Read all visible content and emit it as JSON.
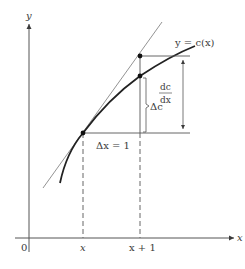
{
  "diagram": {
    "type": "marginal-cost-tangent-approximation",
    "axes": {
      "y_label": "y",
      "x_label": "x",
      "origin_label": "0"
    },
    "ticks": {
      "x": "x",
      "x_plus_1": "x + 1"
    },
    "curve_label": "y = c(x)",
    "delta_x_label": "Δx = 1",
    "delta_c_label": "Δc",
    "derivative_label": {
      "numerator": "dc",
      "denominator": "dx"
    },
    "colors": {
      "line": "#2a2a2a",
      "thin": "#6a6a6a",
      "text": "#3a3a3a"
    }
  }
}
